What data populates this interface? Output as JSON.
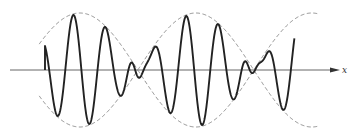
{
  "chart_data": {
    "type": "line",
    "title": "",
    "xlabel": "x",
    "ylabel": "",
    "grid": false,
    "legend": "none",
    "x_range": [
      0,
      2.35
    ],
    "y_range": [
      -1,
      1
    ],
    "wave_start_x": 0,
    "wave_end_x": 2.15,
    "envelope": {
      "style": "dashed",
      "amplitude": 1.0,
      "beat_half_period": 1.0,
      "node_positions": [
        0.8,
        1.8
      ],
      "range": [
        -0.05,
        2.35
      ]
    },
    "carrier": {
      "cycles_per_beat_half_period": 3.6,
      "amplitude": 1.0
    },
    "series": [
      {
        "name": "resultant-wave",
        "style": "solid"
      },
      {
        "name": "upper-envelope",
        "style": "dashed"
      },
      {
        "name": "lower-envelope",
        "style": "dashed"
      }
    ]
  }
}
